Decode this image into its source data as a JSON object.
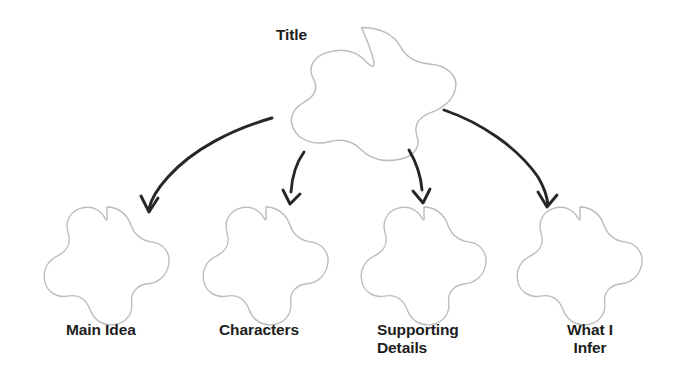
{
  "canvas": {
    "width": 693,
    "height": 377,
    "background": "#ffffff"
  },
  "style": {
    "node_outline_color": "#bcbcbc",
    "node_fill_color": "#ffffff",
    "node_stroke_width": 1,
    "arrow_color": "#262626",
    "label_color": "#1d1d1d"
  },
  "diagram": {
    "type": "graphic-organizer",
    "shape": "five-lobed-flower",
    "root": {
      "id": "title",
      "label": "Title",
      "label_position": "top-left-outside",
      "center_x": 361,
      "center_y": 90,
      "radius": 68
    },
    "children": [
      {
        "id": "main-idea",
        "label": "Main Idea",
        "label_lines": [
          "Main Idea"
        ],
        "label_align": "left",
        "center_x": 107,
        "center_y": 261,
        "radius": 54
      },
      {
        "id": "characters",
        "label": "Characters",
        "label_lines": [
          "Characters"
        ],
        "label_align": "left",
        "center_x": 266,
        "center_y": 261,
        "radius": 54
      },
      {
        "id": "supporting-details",
        "label": "Supporting Details",
        "label_lines": [
          "Supporting",
          "Details"
        ],
        "label_align": "left",
        "center_x": 424,
        "center_y": 261,
        "radius": 54
      },
      {
        "id": "what-i-infer",
        "label": "What I Infer",
        "label_lines": [
          "What I",
          "Infer"
        ],
        "label_align": "center",
        "center_x": 580,
        "center_y": 261,
        "radius": 54
      }
    ],
    "connectors": [
      {
        "id": "arrow-to-main-idea",
        "from": "title",
        "to": "main-idea",
        "style": "hand-drawn-curved-arrow",
        "direction": "down-left"
      },
      {
        "id": "arrow-to-characters",
        "from": "title",
        "to": "characters",
        "style": "hand-drawn-curved-arrow",
        "direction": "down"
      },
      {
        "id": "arrow-to-supporting-details",
        "from": "title",
        "to": "supporting-details",
        "style": "hand-drawn-curved-arrow",
        "direction": "down"
      },
      {
        "id": "arrow-to-what-i-infer",
        "from": "title",
        "to": "what-i-infer",
        "style": "hand-drawn-curved-arrow",
        "direction": "down-right"
      }
    ]
  },
  "labels": {
    "title": "Title",
    "main_idea": "Main Idea",
    "characters": "Characters",
    "supporting_details": "Supporting\nDetails",
    "what_i_infer": "What I\nInfer"
  }
}
